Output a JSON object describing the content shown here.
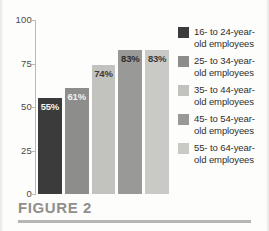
{
  "caption": {
    "text": "FIGURE 2"
  },
  "chart_data": {
    "type": "bar",
    "title": "",
    "subtitle": "",
    "xlabel": "",
    "ylabel": "",
    "ylim": [
      0,
      100
    ],
    "yticks": [
      "0",
      "25",
      "50",
      "75",
      "100"
    ],
    "ytick_values": [
      0,
      25,
      50,
      75,
      100
    ],
    "grid": false,
    "legend_position": "right",
    "categories": [
      "16- to 24-year-old employees",
      "25- to 34-year-old employees",
      "35- to 44-year-old employees",
      "45- to 54-year-old employees",
      "55- to 64-year-old employees"
    ],
    "values": [
      55,
      61,
      74,
      83,
      83
    ],
    "data_labels": [
      "55%",
      "61%",
      "74%",
      "83%",
      "83%"
    ],
    "bar_colors": [
      "#3b3b3b",
      "#8d8d8b",
      "#c2c2bf",
      "#999997",
      "#c9c9c6"
    ],
    "data_label_colors": [
      "#f2f2f0",
      "#f2f2f0",
      "#3a3a38",
      "#2e2e2c",
      "#3a3a38"
    ]
  },
  "legend": {
    "items": [
      {
        "label": "16- to 24-year-old employees",
        "color": "#3b3b3b"
      },
      {
        "label": "25- to 34-year-old employees",
        "color": "#8d8d8b"
      },
      {
        "label": "35- to 44-year-old employees",
        "color": "#c2c2bf"
      },
      {
        "label": "45- to 54-year-old employees",
        "color": "#999997"
      },
      {
        "label": "55- to 64-year-old employees",
        "color": "#c9c9c6"
      }
    ]
  }
}
